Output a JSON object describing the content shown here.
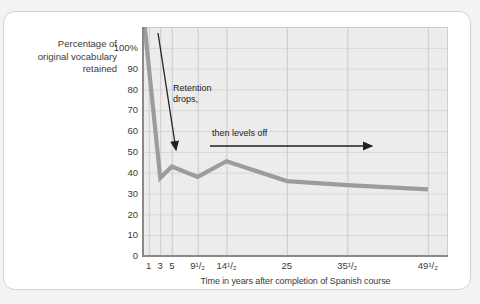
{
  "chart_data": {
    "type": "line",
    "title": "",
    "xlabel": "Time in years after completion of Spanish course",
    "ylabel": "Percentage of\noriginal vocabulary\nretained",
    "xlim": [
      0,
      53
    ],
    "ylim": [
      0,
      110
    ],
    "grid": true,
    "x_ticks": [
      {
        "year": 1,
        "label": "1"
      },
      {
        "year": 3,
        "label": "3"
      },
      {
        "year": 5,
        "label": "5"
      },
      {
        "year": 9.5,
        "label": "9¹/₂"
      },
      {
        "year": 14.5,
        "label": "14¹/₂"
      },
      {
        "year": 25,
        "label": "25"
      },
      {
        "year": 35.5,
        "label": "35¹/₂"
      },
      {
        "year": 49.5,
        "label": "49¹/₂"
      }
    ],
    "y_ticks": [
      {
        "value": 0,
        "label": "0"
      },
      {
        "value": 10,
        "label": "10"
      },
      {
        "value": 20,
        "label": "20"
      },
      {
        "value": 30,
        "label": "30"
      },
      {
        "value": 40,
        "label": "40"
      },
      {
        "value": 50,
        "label": "50"
      },
      {
        "value": 60,
        "label": "60"
      },
      {
        "value": 70,
        "label": "70"
      },
      {
        "value": 80,
        "label": "80"
      },
      {
        "value": 90,
        "label": "90"
      },
      {
        "value": 100,
        "label": "100%"
      }
    ],
    "series": [
      {
        "name": "vocabulary-retention",
        "points": [
          [
            0,
            118
          ],
          [
            3,
            37.5
          ],
          [
            5,
            43
          ],
          [
            9.5,
            38
          ],
          [
            14.5,
            45.5
          ],
          [
            25,
            36
          ],
          [
            35.5,
            34
          ],
          [
            49.5,
            32
          ]
        ]
      }
    ],
    "annotations": [
      {
        "id": "retention-drops",
        "text": "Retention\ndrops,",
        "left_px": 173,
        "top_px": 83
      },
      {
        "id": "then-levels-off",
        "text": "then levels off",
        "left_px": 212,
        "top_px": 128
      }
    ],
    "arrows": [
      {
        "id": "drops-arrow",
        "from": [
          158,
          33
        ],
        "to": [
          176,
          150
        ]
      },
      {
        "id": "levels-arrow",
        "from": [
          210,
          146
        ],
        "to": [
          372,
          146
        ]
      }
    ],
    "colors": {
      "page_bg": "#f4f2f2",
      "card_bg": "#ffffff",
      "card_border": "#d2d1d1",
      "plot_bg": "#edecec",
      "grid_h": "#d8d7d7",
      "grid_v": "#cbcaca",
      "plot_border": "#cfcece",
      "axis": "#8a8888",
      "line": "#9d9c9c",
      "text": "#3b3a3a",
      "annotation": "#222222"
    },
    "legend": null
  }
}
